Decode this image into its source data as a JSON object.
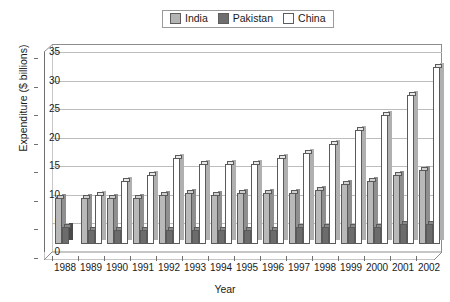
{
  "chart_data": {
    "type": "bar",
    "title": "",
    "xlabel": "Year",
    "ylabel": "Expenditure ($ billions)",
    "ylim": [
      0,
      35
    ],
    "ytick_step": 5,
    "yticks": [
      0,
      5,
      10,
      15,
      20,
      25,
      30,
      35
    ],
    "grid": true,
    "legend_position": "top-center",
    "categories": [
      "1988",
      "1989",
      "1990",
      "1991",
      "1992",
      "1993",
      "1994",
      "1995",
      "1996",
      "1997",
      "1998",
      "1999",
      "2000",
      "2001",
      "2002"
    ],
    "series": [
      {
        "name": "India",
        "color": "#b9b9b9",
        "values": [
          8,
          8,
          8,
          8,
          8.5,
          9,
          8.5,
          9,
          9,
          9,
          9.5,
          10.5,
          11,
          12,
          13
        ]
      },
      {
        "name": "Pakistan",
        "color": "#6c6c6c",
        "values": [
          3,
          2.5,
          2.5,
          2.5,
          2.5,
          2.5,
          2.5,
          2.5,
          2.5,
          3,
          3,
          3,
          3,
          3.5,
          3.5
        ]
      },
      {
        "name": "China",
        "color": "#ffffff",
        "values": [
          0,
          8.5,
          11,
          12,
          15,
          14,
          14,
          14,
          15,
          16,
          17.5,
          20,
          22.5,
          26,
          31
        ]
      }
    ]
  },
  "legend": {
    "items": [
      {
        "label": "India",
        "swatch": "india-swatch"
      },
      {
        "label": "Pakistan",
        "swatch": "pakistan-swatch"
      },
      {
        "label": "China",
        "swatch": "china-swatch"
      }
    ]
  },
  "axes": {
    "y_title": "Expenditure ($ billions)",
    "x_title": "Year"
  }
}
